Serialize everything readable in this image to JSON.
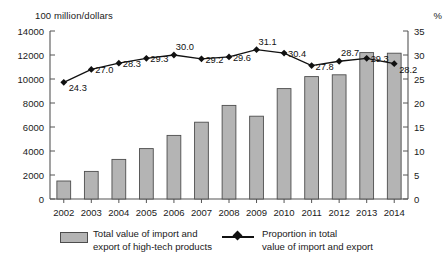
{
  "chart_data": {
    "type": "bar",
    "title": "",
    "categories": [
      "2002",
      "2003",
      "2004",
      "2005",
      "2006",
      "2007",
      "2008",
      "2009",
      "2010",
      "2011",
      "2012",
      "2013",
      "2014"
    ],
    "xlabel": "",
    "ylabel_left": "100 million/dollars",
    "ylabel_right": "%",
    "ylim_left": [
      0,
      14000
    ],
    "ylim_right": [
      0,
      35
    ],
    "ytick_left": [
      "0",
      "2000",
      "4000",
      "6000",
      "8000",
      "10000",
      "12000",
      "14000"
    ],
    "ytick_right": [
      "0",
      "5",
      "10",
      "15",
      "20",
      "25",
      "30",
      "35"
    ],
    "grid": false,
    "legend_position": "bottom",
    "series": [
      {
        "name": "Total value of import and export of high-tech products",
        "type": "bar",
        "axis": "left",
        "values": [
          1500,
          2300,
          3300,
          4200,
          5300,
          6400,
          7800,
          6900,
          9200,
          10200,
          10350,
          12200,
          12150
        ]
      },
      {
        "name": "Proportion in total value of import and export",
        "type": "line",
        "axis": "right",
        "values": [
          24.3,
          27.0,
          28.3,
          29.3,
          30.0,
          29.2,
          29.6,
          31.1,
          30.4,
          27.8,
          28.7,
          29.3,
          28.2
        ],
        "labels": [
          "24.3",
          "27.0",
          "28.3",
          "29.3",
          "30.0",
          "29.2",
          "29.6",
          "31.1",
          "30.4",
          "27.8",
          "28.7",
          "29.3",
          "28.2"
        ]
      }
    ]
  },
  "legend": {
    "bar_label": "Total value of import and\nexport of high-tech products",
    "line_label": "Proportion in total\nvalue of import and export"
  },
  "colors": {
    "bar_fill": "#b4b4b4",
    "bar_stroke": "#4d4d4d",
    "line": "#111111",
    "axis": "#555555",
    "text": "#1a1a1a"
  }
}
